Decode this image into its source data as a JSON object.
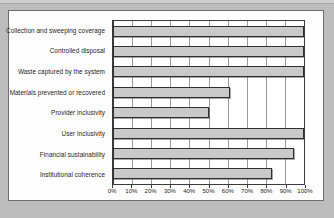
{
  "chart_data": {
    "type": "bar",
    "orientation": "horizontal",
    "title": "",
    "xlabel": "",
    "ylabel": "",
    "xlim": [
      0,
      100
    ],
    "grid": true,
    "legend": "none",
    "bar_color": "#c9c9c9",
    "bar_edge_color": "#2f2f2f",
    "plot_background": "#ffffff",
    "axis_color": "#3b3b3b",
    "categories": [
      "Collection and sweeping coverage",
      "Controlled disposal",
      "Waste captured by the system",
      "Materials prevented or recovered",
      "Provider inclusivity",
      "User inclusivity",
      "Financial sustainability",
      "Institutional coherence"
    ],
    "values": [
      100,
      100,
      100,
      61,
      50,
      100,
      95,
      83
    ],
    "value_suffix": "%",
    "xticks": [
      0,
      10,
      20,
      30,
      40,
      50,
      60,
      70,
      80,
      90,
      100
    ],
    "xticklabels": [
      "0%",
      "10%",
      "20%",
      "30%",
      "40%",
      "50%",
      "60%",
      "70%",
      "80%",
      "90%",
      "100%"
    ]
  }
}
